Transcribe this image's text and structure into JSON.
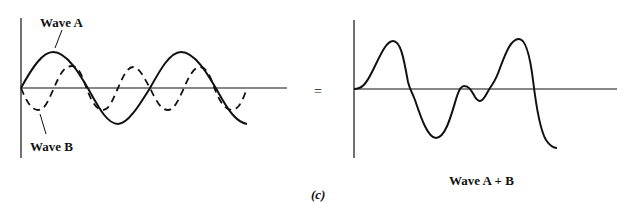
{
  "figure": {
    "panel_label": "(c)",
    "operator": "=",
    "left_panel": {
      "wave_a_label": "Wave A",
      "wave_b_label": "Wave B",
      "wave_a_style": "solid",
      "wave_b_style": "dashed"
    },
    "right_panel": {
      "sum_label": "Wave A + B",
      "sum_style": "solid"
    },
    "colors": {
      "line": "#111111",
      "background": "#ffffff"
    }
  }
}
